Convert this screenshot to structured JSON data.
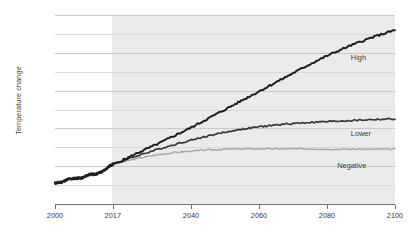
{
  "chart_data": {
    "type": "line",
    "title": "",
    "xlabel": "",
    "ylabel": "Temperature change",
    "xlim": [
      2000,
      2100
    ],
    "ylim": [
      0,
      5
    ],
    "grid": true,
    "gridlines_major": [
      0,
      1,
      2,
      3,
      4,
      5
    ],
    "gridlines_minor": [
      0.5,
      1.5,
      2.5,
      3.5,
      4.5
    ],
    "legend_position": "inline-right",
    "x_ticks": [
      2000,
      2017,
      2040,
      2060,
      2080,
      2100
    ],
    "x_tick_labels": [
      "2000",
      "2017",
      "2040",
      "2060",
      "2080",
      "2100"
    ],
    "y_ticks": [
      0,
      1,
      2,
      3,
      4,
      5
    ],
    "y_tick_labels": [
      "0°C",
      "1°C",
      "2°C",
      "3°C",
      "4°C",
      "5°C"
    ],
    "projection_start_year": 2017,
    "shaded_region": {
      "from": 2017,
      "to": 2100,
      "color": "#ebebeb"
    },
    "historical": {
      "name": "Historical",
      "color": "#1f1f1f",
      "x": [
        2000,
        2002,
        2004,
        2006,
        2008,
        2010,
        2012,
        2014,
        2016,
        2017
      ],
      "values": [
        0.55,
        0.58,
        0.66,
        0.68,
        0.69,
        0.78,
        0.79,
        0.86,
        1.0,
        1.05
      ]
    },
    "series": [
      {
        "name": "High",
        "label": "High",
        "color": "#1f1f1f",
        "x": [
          2017,
          2020,
          2025,
          2030,
          2035,
          2040,
          2045,
          2050,
          2055,
          2060,
          2065,
          2070,
          2075,
          2080,
          2085,
          2090,
          2095,
          2100
        ],
        "values": [
          1.05,
          1.16,
          1.38,
          1.58,
          1.8,
          2.02,
          2.26,
          2.5,
          2.74,
          2.98,
          3.22,
          3.46,
          3.7,
          3.92,
          4.12,
          4.3,
          4.46,
          4.6
        ]
      },
      {
        "name": "Lower",
        "label": "Lower",
        "color": "#3a3a3a",
        "x": [
          2017,
          2020,
          2025,
          2030,
          2035,
          2040,
          2045,
          2050,
          2055,
          2060,
          2065,
          2070,
          2075,
          2080,
          2085,
          2090,
          2095,
          2100
        ],
        "values": [
          1.05,
          1.14,
          1.3,
          1.44,
          1.57,
          1.69,
          1.8,
          1.9,
          1.98,
          2.04,
          2.09,
          2.13,
          2.16,
          2.18,
          2.2,
          2.22,
          2.24,
          2.25
        ]
      },
      {
        "name": "Negative",
        "label": "Negative",
        "color": "#a9abad",
        "x": [
          2017,
          2020,
          2025,
          2030,
          2035,
          2040,
          2045,
          2050,
          2055,
          2060,
          2065,
          2070,
          2075,
          2080,
          2085,
          2090,
          2095,
          2100
        ],
        "values": [
          1.05,
          1.12,
          1.22,
          1.3,
          1.36,
          1.4,
          1.43,
          1.45,
          1.46,
          1.46,
          1.46,
          1.46,
          1.46,
          1.45,
          1.45,
          1.45,
          1.45,
          1.45
        ]
      }
    ],
    "series_label_positions": [
      {
        "name": "High",
        "x": 2087,
        "y": 3.85
      },
      {
        "name": "Lower",
        "x": 2087,
        "y": 1.85
      },
      {
        "name": "Negative",
        "x": 2083,
        "y": 1.0
      }
    ]
  }
}
